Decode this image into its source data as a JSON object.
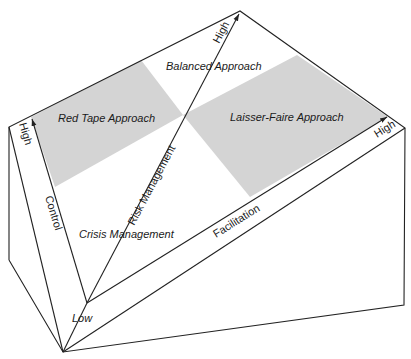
{
  "diagram": {
    "regions": {
      "red_tape": "Red Tape Approach",
      "balanced": "Balanced Approach",
      "laisser_faire": "Laisser-Faire Approach",
      "crisis": "Crisis Management"
    },
    "axes": {
      "control": {
        "label": "Control",
        "high": "High"
      },
      "risk": {
        "label": "Risk Management",
        "high": "High"
      },
      "facilitation": {
        "label": "Facilitation",
        "high": "High"
      },
      "origin": "Low"
    },
    "colors": {
      "shade": "#d4d4d4",
      "line": "#222222"
    }
  }
}
